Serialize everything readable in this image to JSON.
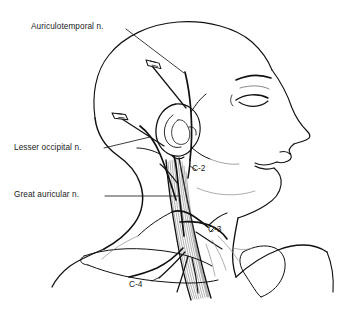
{
  "figure": {
    "caption": ""
  },
  "labels": {
    "auriculotemporal": "Auriculotemporal n.",
    "lesser_occipital": "Lesser occipital n.",
    "great_auricular": "Great auricular n."
  },
  "segments": {
    "c2": "C-2",
    "c3": "C-3",
    "c4": "C-4"
  },
  "colors": {
    "ink": "#1a1a1a",
    "line": "#111111",
    "muscle_hatch": "#5a5a5a",
    "faint": "#8d8d8d",
    "background": "#ffffff"
  },
  "anatomy": {
    "structures": [
      "skull",
      "face-profile",
      "eyebrow",
      "closed-eye",
      "nose",
      "lips",
      "chin",
      "ear-auricle",
      "sternocleidomastoid-muscle",
      "neck-contour",
      "clavicle",
      "shoulder",
      "trapezius-border"
    ],
    "instruments": [
      "needle-upper-auriculotemporal",
      "needle-lower-lesser-occipital"
    ],
    "nerves": [
      "auriculotemporal",
      "lesser-occipital",
      "great-auricular",
      "transverse-cervical",
      "supraclavicular"
    ]
  }
}
